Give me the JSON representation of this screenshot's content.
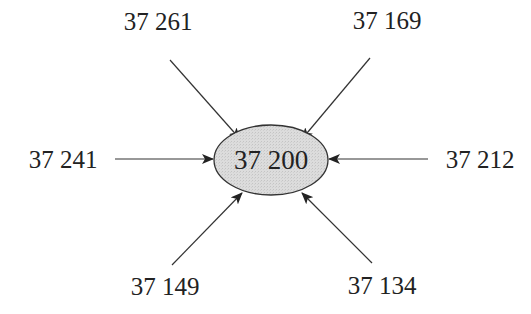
{
  "diagram": {
    "center": {
      "label": "37 200",
      "fill": "#d9d9d9",
      "stroke": "#333333"
    },
    "nodes": [
      {
        "id": "top-left",
        "label": "37 261"
      },
      {
        "id": "top-right",
        "label": "37 169"
      },
      {
        "id": "left",
        "label": "37 241"
      },
      {
        "id": "right",
        "label": "37 212"
      },
      {
        "id": "bottom-left",
        "label": "37 149"
      },
      {
        "id": "bottom-right",
        "label": "37 134"
      }
    ],
    "edges_direction": "inward",
    "edge_color": "#333333"
  }
}
